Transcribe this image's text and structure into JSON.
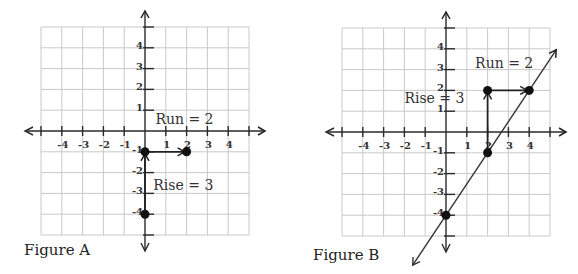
{
  "chart_data": [
    {
      "type": "line",
      "title": "Figure A",
      "xlim": [
        -5,
        5
      ],
      "ylim": [
        -5,
        5
      ],
      "grid": true,
      "x_tick_labels": [
        "-4",
        "-3",
        "-2",
        "-1",
        "1",
        "2",
        "3",
        "4"
      ],
      "x_ticks": [
        -4,
        -3,
        -2,
        -1,
        1,
        2,
        3,
        4
      ],
      "y_tick_labels": [
        "4",
        "3",
        "2",
        "1",
        "-1",
        "-2",
        "-3",
        "-4"
      ],
      "y_ticks": [
        4,
        3,
        2,
        1,
        -1,
        -2,
        -3,
        -4
      ],
      "points": [
        {
          "x": 0,
          "y": -4
        },
        {
          "x": 0,
          "y": -1
        },
        {
          "x": 2,
          "y": -1
        }
      ],
      "rise_arrow": {
        "from": [
          0,
          -4
        ],
        "to": [
          0,
          -1
        ]
      },
      "run_arrow": {
        "from": [
          0,
          -1
        ],
        "to": [
          2,
          -1
        ]
      },
      "annotations": [
        {
          "text": "Run = 2",
          "at": [
            0.5,
            0.35
          ]
        },
        {
          "text": "Rise = 3",
          "at": [
            0.4,
            -2.85
          ]
        }
      ],
      "line": null
    },
    {
      "type": "line",
      "title": "Figure B",
      "xlim": [
        -5,
        5
      ],
      "ylim": [
        -5,
        5
      ],
      "grid": true,
      "x_tick_labels": [
        "-4",
        "-3",
        "-2",
        "-1",
        "1",
        "2",
        "3",
        "4"
      ],
      "x_ticks": [
        -4,
        -3,
        -2,
        -1,
        1,
        2,
        3,
        4
      ],
      "y_tick_labels": [
        "4",
        "3",
        "2",
        "1",
        "-1",
        "-2",
        "-3",
        "-4"
      ],
      "y_ticks": [
        4,
        3,
        2,
        1,
        -1,
        -2,
        -3,
        -4
      ],
      "points": [
        {
          "x": 0,
          "y": -4
        },
        {
          "x": 2,
          "y": -1
        },
        {
          "x": 2,
          "y": 2
        },
        {
          "x": 4,
          "y": 2
        }
      ],
      "rise_arrow": {
        "from": [
          2,
          -1
        ],
        "to": [
          2,
          2
        ]
      },
      "run_arrow": {
        "from": [
          2,
          2
        ],
        "to": [
          4,
          2
        ]
      },
      "annotations": [
        {
          "text": "Run = 2",
          "at": [
            1.4,
            3.1
          ]
        },
        {
          "text": "Rise = 3",
          "at": [
            -2.0,
            1.4
          ]
        }
      ],
      "line": {
        "slope": 1.5,
        "intercept": -4,
        "x_range": [
          -1.6,
          5.3
        ]
      }
    }
  ]
}
